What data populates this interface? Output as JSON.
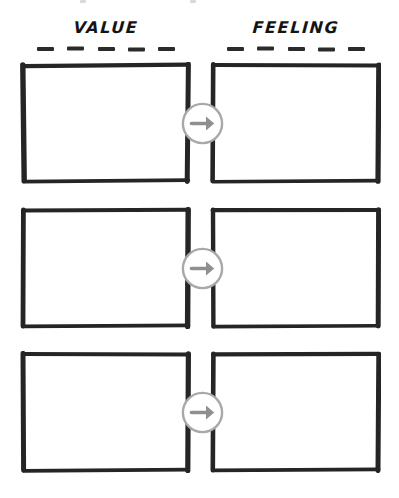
{
  "worksheet": {
    "background_color": "#ffffff",
    "ink_color": "#2b2b2b",
    "accent_color": "#9a9a9a",
    "columns": [
      {
        "id": "value",
        "label": "VALUE",
        "dash_count": 5
      },
      {
        "id": "feeling",
        "label": "FEELING",
        "dash_count": 5
      }
    ],
    "rows": [
      {
        "id": "row-1",
        "left_box": {
          "name": "value-box-1",
          "value": "",
          "placeholder": ""
        },
        "right_box": {
          "name": "feeling-box-1",
          "value": "",
          "placeholder": ""
        },
        "connector": {
          "icon": "circle-arrow-right-icon",
          "color": "#9a9a9a"
        }
      },
      {
        "id": "row-2",
        "left_box": {
          "name": "value-box-2",
          "value": "",
          "placeholder": ""
        },
        "right_box": {
          "name": "feeling-box-2",
          "value": "",
          "placeholder": ""
        },
        "connector": {
          "icon": "circle-arrow-right-icon",
          "color": "#9a9a9a"
        }
      },
      {
        "id": "row-3",
        "left_box": {
          "name": "value-box-3",
          "value": "",
          "placeholder": ""
        },
        "right_box": {
          "name": "feeling-box-3",
          "value": "",
          "placeholder": ""
        },
        "connector": {
          "icon": "circle-arrow-right-icon",
          "color": "#9a9a9a"
        }
      }
    ]
  }
}
